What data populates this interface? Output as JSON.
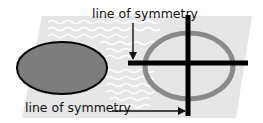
{
  "diagram": {
    "labels": {
      "top": "line of symmetry",
      "bottom": "line of symmetry"
    },
    "shapes": {
      "filled_ellipse": {
        "fill": "#7d7d7d",
        "stroke": "#000000"
      },
      "ring_ellipse": {
        "stroke": "#8a8a8a"
      },
      "symmetry_lines": {
        "stroke": "#000000"
      }
    },
    "colors": {
      "background": "#ffffff",
      "panel": "#e6e6e6",
      "waves": "#ffffff"
    }
  }
}
